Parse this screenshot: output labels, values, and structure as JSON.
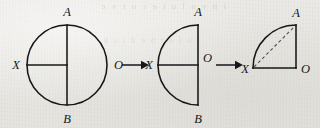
{
  "figure": {
    "name": "folding-circle-into-quarter-sector",
    "background_color": "#e9e8e4",
    "ink_color": "#17161a",
    "dash_color": "#55545a",
    "bleed_through_text": "i n v o l u t e   c u r v e",
    "bleed_through_text_2": "f o l d   t h e   d i s k",
    "panels": [
      {
        "id": "panel-1",
        "shape": "full-circle",
        "description": "Full circle with vertical diameter A-B and horizontal radius X to center",
        "center": {
          "x": 67,
          "y": 65
        },
        "radius": 40,
        "labels": {
          "top": "A",
          "bottom": "B",
          "left": "X"
        }
      },
      {
        "id": "panel-2",
        "shape": "half-circle",
        "description": "Left semicircle, vertical chord A-B on the right, horizontal radius X to O",
        "center": {
          "x": 198,
          "y": 65
        },
        "radius": 40,
        "labels": {
          "top": "A",
          "bottom": "B",
          "left": "X",
          "center": "O"
        }
      },
      {
        "id": "panel-3",
        "shape": "quarter-circle",
        "description": "Quarter circle sector with dashed chord from X to A",
        "corner": {
          "x": 296,
          "y": 68
        },
        "radius": 43,
        "labels": {
          "top": "A",
          "left": "X",
          "corner": "O"
        }
      }
    ],
    "arrows": [
      {
        "id": "arrow-1",
        "glyph": "right-arrow",
        "from": "panel-1",
        "to": "panel-2",
        "x1": 122,
        "x2": 148,
        "y": 65
      },
      {
        "id": "arrow-2",
        "glyph": "right-arrow",
        "from": "panel-2",
        "to": "panel-3",
        "x1": 216,
        "x2": 242,
        "y": 65
      }
    ],
    "labels": {
      "A": "A",
      "B": "B",
      "X": "X",
      "O": "O"
    }
  }
}
